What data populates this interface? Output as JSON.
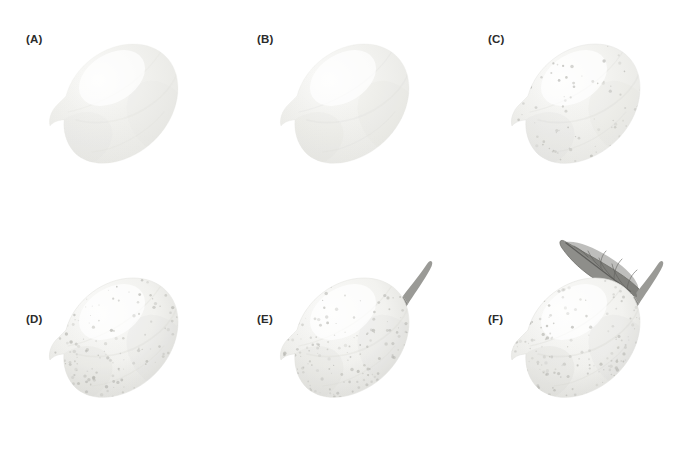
{
  "figure": {
    "kind": "watercolor-step-by-step-illustration",
    "background_color": "#ffffff",
    "label_color": "#2b2b2b",
    "grid": {
      "rows": 2,
      "columns": 3
    }
  },
  "palette": {
    "lemon_light": "#fbfbfa",
    "lemon_mid": "#f2f2ef",
    "lemon_shadow": "#e4e4e0",
    "lemon_deep_shadow": "#d6d6d2",
    "stipple": "#b9b9b4",
    "stem": "#9a9a96",
    "stem_dark": "#7e7e7a",
    "leaf": "#8e8e8a",
    "leaf_dark": "#6e6e6a",
    "leaf_vein": "#5f5f5c"
  },
  "panels": [
    {
      "id": "A",
      "label": "(A)",
      "step_description": "Pale base wash of the lemon silhouette, flat and almost untinted",
      "has_stipple": false,
      "has_stem": false,
      "has_leaf": false,
      "shading_level": 1,
      "stipple_density": 0
    },
    {
      "id": "B",
      "label": "(B)",
      "step_description": "Second wash adds soft form shadow along the lower-left and under-curve",
      "has_stipple": false,
      "has_stem": false,
      "has_leaf": false,
      "shading_level": 2,
      "stipple_density": 0
    },
    {
      "id": "C",
      "label": "(C)",
      "step_description": "Rind texture stippled in with fine dots across the shadow side",
      "has_stipple": true,
      "has_stem": false,
      "has_leaf": false,
      "shading_level": 3,
      "stipple_density": 70
    },
    {
      "id": "D",
      "label": "(D)",
      "step_description": "Shadows deepened and stippling built up for a denser peel texture",
      "has_stipple": true,
      "has_stem": false,
      "has_leaf": false,
      "shading_level": 4,
      "stipple_density": 110
    },
    {
      "id": "E",
      "label": "(E)",
      "step_description": "Curved stem painted at the top-right of the fruit",
      "has_stipple": true,
      "has_stem": true,
      "has_leaf": false,
      "shading_level": 4,
      "stipple_density": 120
    },
    {
      "id": "F",
      "label": "(F)",
      "step_description": "Finished study: leaf with midrib and lateral veins added to the stem",
      "has_stipple": true,
      "has_stem": true,
      "has_leaf": true,
      "shading_level": 5,
      "stipple_density": 130
    }
  ]
}
